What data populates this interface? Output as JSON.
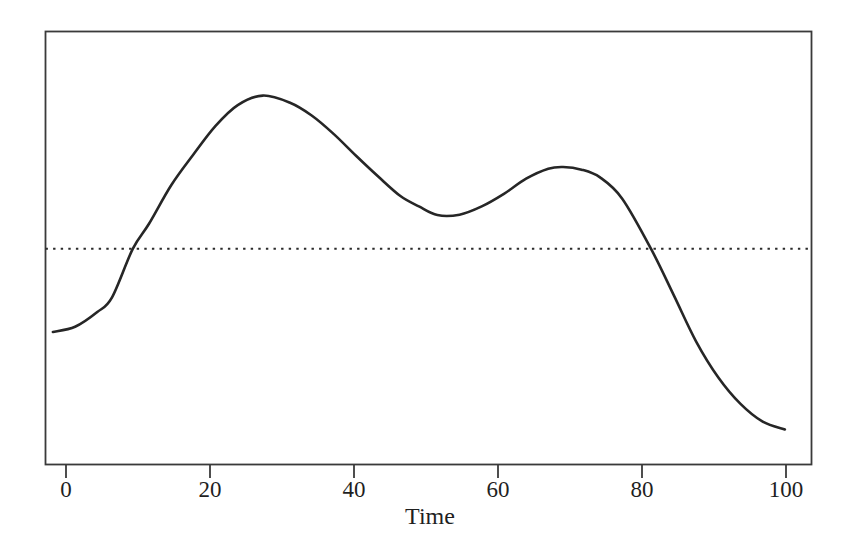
{
  "chart_data": {
    "type": "line",
    "title": "",
    "xlabel": "Time",
    "ylabel": "",
    "xlim": [
      0,
      103.6
    ],
    "ylim": [
      0,
      1
    ],
    "grid": false,
    "legend": null,
    "axis_box": true,
    "x_ticks": [
      {
        "value": 0,
        "label": "0"
      },
      {
        "value": 20,
        "label": "20"
      },
      {
        "value": 40,
        "label": "40"
      },
      {
        "value": 60,
        "label": "60"
      },
      {
        "value": 80,
        "label": "80"
      },
      {
        "value": 100,
        "label": "100"
      }
    ],
    "y_ticks": [],
    "series": [
      {
        "name": "curve",
        "style": "solid",
        "color": "#262626",
        "width": 2.6,
        "x": [
          1.0,
          4.0,
          7.0,
          9.0,
          11.8,
          14.0,
          17.0,
          20.0,
          23.0,
          26.0,
          29.4,
          33.0,
          36.0,
          39.0,
          42.0,
          45.0,
          48.0,
          50.5,
          53.0,
          56.0,
          59.0,
          62.0,
          65.0,
          68.0,
          70.0,
          72.5,
          75.0,
          78.0,
          81.9,
          85.0,
          88.0,
          91.0,
          94.0,
          97.0,
          100.0
        ],
        "y": [
          0.306,
          0.318,
          0.352,
          0.386,
          0.498,
          0.556,
          0.645,
          0.716,
          0.782,
          0.83,
          0.852,
          0.836,
          0.806,
          0.763,
          0.713,
          0.665,
          0.62,
          0.596,
          0.576,
          0.577,
          0.596,
          0.625,
          0.66,
          0.683,
          0.687,
          0.681,
          0.663,
          0.614,
          0.498,
          0.39,
          0.284,
          0.201,
          0.14,
          0.099,
          0.081
        ]
      },
      {
        "name": "threshold",
        "style": "dotted",
        "color": "#2b2b2b",
        "width": 2.0,
        "y_value": 0.498,
        "x_start": 0,
        "x_end": 103.6
      }
    ],
    "annotations": [],
    "crossings": [
      {
        "x": 11.8,
        "y": 0.498,
        "direction": "rising"
      },
      {
        "x": 81.9,
        "y": 0.498,
        "direction": "falling"
      }
    ],
    "extrema": [
      {
        "type": "local-max",
        "x": 29.4,
        "y": 0.852
      },
      {
        "type": "local-min",
        "x": 53.0,
        "y": 0.576
      },
      {
        "type": "local-max",
        "x": 70.0,
        "y": 0.687
      }
    ],
    "colors": {
      "background": "#ffffff",
      "axis": "#3a3a3a",
      "curve": "#262626",
      "threshold": "#2b2b2b",
      "text": "#1f1f1f"
    }
  },
  "figure": {
    "xlabel_text": "Time"
  }
}
